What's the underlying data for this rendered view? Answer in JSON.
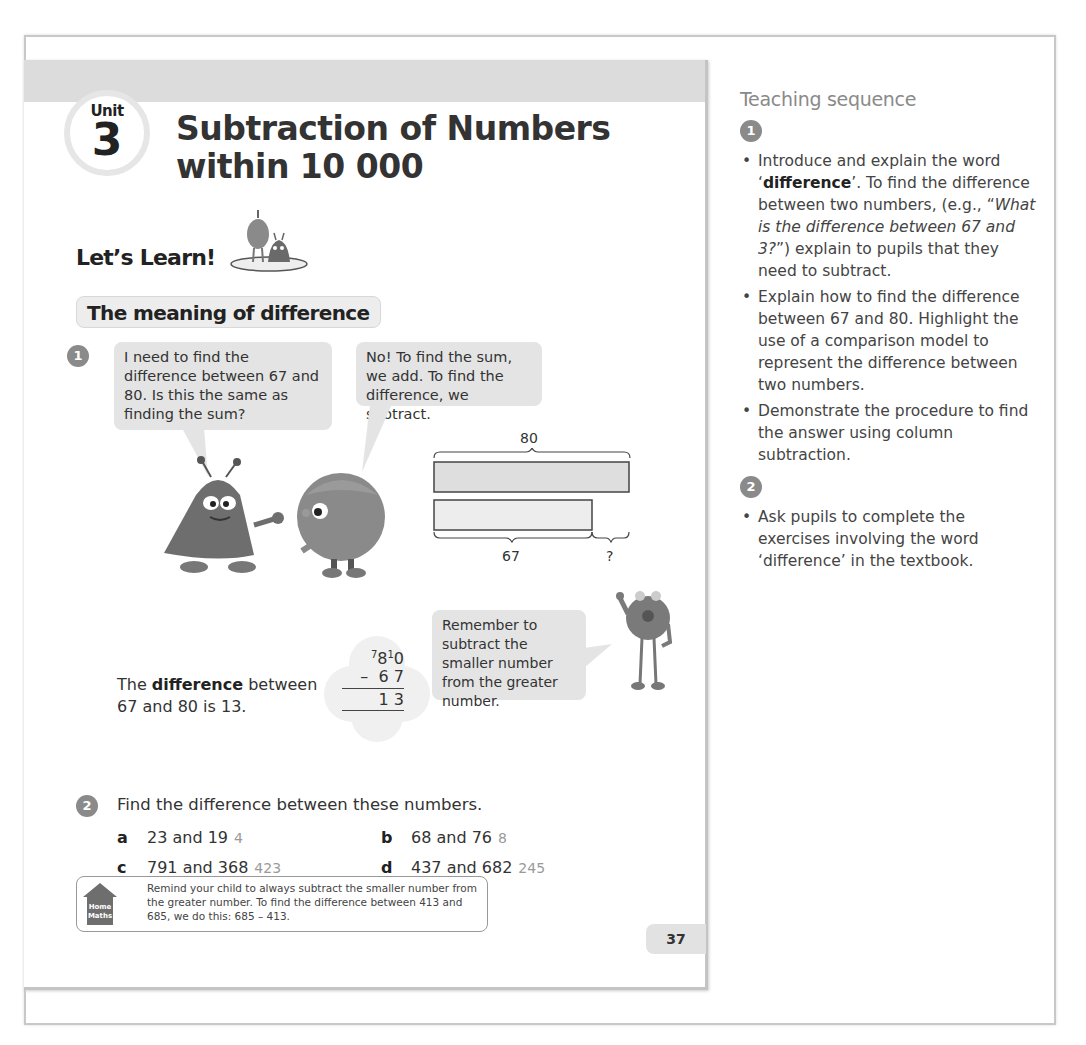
{
  "page": {
    "unit_label": "Unit",
    "unit_number": "3",
    "title_line1": "Subtraction of Numbers",
    "title_line2": "within 10 000",
    "lets_learn": "Let’s Learn!",
    "section_title": "The meaning of difference",
    "step1_number": "1",
    "bubble1": "I need to find the difference between 67 and 80. Is this the same as finding the sum?",
    "bubble2": "No! To find the sum, we add. To find the difference, we subtract.",
    "bar_model": {
      "top_total": "80",
      "bottom_part": "67",
      "bottom_unknown": "?"
    },
    "difference_statement": {
      "prefix": "The ",
      "bold": "difference",
      "suffix": " between",
      "line2": "67 and 80 is 13."
    },
    "column_subtraction": {
      "top_regroup_tens": "7",
      "top_tens": "8",
      "top_regroup_ones": "1",
      "top_ones": "0",
      "operator": "–",
      "sub_tens": "6",
      "sub_ones": "7",
      "result_tens": "1",
      "result_ones": "3"
    },
    "bubble3": "Remember to subtract the smaller number from the greater number.",
    "step2_number": "2",
    "exercise_heading": "Find the difference between these numbers.",
    "exercises": [
      {
        "letter": "a",
        "question": "23 and 19",
        "answer": "4"
      },
      {
        "letter": "b",
        "question": "68 and 76",
        "answer": "8"
      },
      {
        "letter": "c",
        "question": "791 and 368",
        "answer": "423"
      },
      {
        "letter": "d",
        "question": "437 and 682",
        "answer": "245"
      }
    ],
    "home_maths": {
      "icon_line1": "Home",
      "icon_line2": "Maths",
      "text": "Remind your child to always subtract the smaller number from the greater number. To find the difference between 413 and 685, we do this: 685 – 413."
    },
    "page_number": "37"
  },
  "teaching": {
    "title": "Teaching sequence",
    "step1_number": "1",
    "step1_items": [
      {
        "pre": "Introduce and explain the word ‘",
        "bold": "difference",
        "post": "’. To find the difference between two numbers, (e.g., “",
        "italic": "What is the difference between 67 and 3?",
        "tail": "”) explain to pupils that they need to subtract."
      },
      {
        "text": "Explain how to find the difference between 67 and 80. Highlight the use of a comparison model to represent the difference between two numbers."
      },
      {
        "text": "Demonstrate the procedure to find the answer using column subtraction."
      }
    ],
    "step2_number": "2",
    "step2_items": [
      {
        "text": "Ask pupils to complete the exercises involving the word ‘difference’ in the textbook."
      }
    ]
  },
  "colors": {
    "band": "#dcdcdc",
    "bubble": "#e4e4e4",
    "step_circle": "#8a8a8a",
    "answer_text": "#9a9a9a",
    "heading_grey": "#8a8a8a"
  }
}
